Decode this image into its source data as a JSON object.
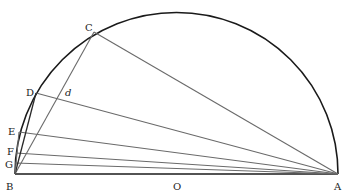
{
  "diagram": {
    "type": "semicircle-chords",
    "points": {
      "A": {
        "label": "A",
        "x": 338,
        "y": 174
      },
      "B": {
        "label": "B",
        "x": 15,
        "y": 174
      },
      "O": {
        "label": "O",
        "x": 176.5,
        "y": 174
      },
      "C": {
        "label": "C",
        "x": 94,
        "y": 32
      },
      "D": {
        "label": "D",
        "x": 36,
        "y": 93
      },
      "E": {
        "label": "E",
        "x": 19,
        "y": 132
      },
      "F": {
        "label": "F",
        "x": 16,
        "y": 153
      },
      "G": {
        "label": "G",
        "x": 15.3,
        "y": 163
      },
      "d": {
        "label": "d",
        "x": 62,
        "y": 101
      }
    },
    "radius": 161.5,
    "segments": [
      {
        "from": "B",
        "to": "A",
        "kind": "diameter"
      },
      {
        "from": "C",
        "to": "A",
        "kind": "chord"
      },
      {
        "from": "D",
        "to": "A",
        "kind": "chord"
      },
      {
        "from": "E",
        "to": "A",
        "kind": "chord"
      },
      {
        "from": "F",
        "to": "A",
        "kind": "chord"
      },
      {
        "from": "G",
        "to": "A",
        "kind": "chord"
      },
      {
        "from": "B",
        "to": "C",
        "kind": "chord"
      },
      {
        "from": "B",
        "to": "D",
        "kind": "chord-dark"
      },
      {
        "from": "B",
        "to": "E",
        "kind": "chord"
      }
    ],
    "labels": {
      "A": "A",
      "B": "B",
      "C": "C",
      "D": "D",
      "d": "d",
      "E": "E",
      "F": "F",
      "G": "G",
      "O": "O"
    }
  }
}
